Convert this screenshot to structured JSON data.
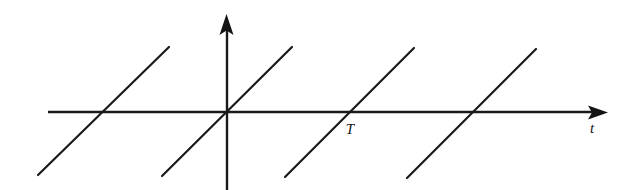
{
  "figure": {
    "kind": "sawtooth-waveform-diagram",
    "background_color": "#ffffff",
    "stroke_color": "#1a1a1a"
  },
  "axes": {
    "horizontal": {
      "label": "t",
      "label_x": 592,
      "label_y": 133,
      "start_x": 48,
      "end_x": 608,
      "y": 112,
      "arrow": "right-arrow-icon"
    },
    "vertical": {
      "label": "",
      "x": 227,
      "top_y": 14,
      "bottom_y": 190,
      "arrow": "up-arrow-icon"
    }
  },
  "annotations": [
    {
      "text": "T",
      "x": 350,
      "y": 134
    }
  ],
  "chart_data": {
    "type": "line",
    "title": "",
    "subtitle": "",
    "xlabel": "t",
    "ylabel": "",
    "grid": false,
    "legend": "none",
    "period_px": 122,
    "zero_crossings_px": [
      105,
      227,
      349,
      471
    ],
    "tick_labels": [
      "T"
    ],
    "xlim": [
      48,
      608
    ],
    "ylim": [
      190,
      14
    ],
    "series": [
      {
        "name": "sawtooth-segment-1",
        "points": [
          [
            38,
            175
          ],
          [
            169,
            47
          ]
        ]
      },
      {
        "name": "sawtooth-segment-2",
        "points": [
          [
            162,
            176
          ],
          [
            292,
            47
          ]
        ]
      },
      {
        "name": "sawtooth-segment-3",
        "points": [
          [
            285,
            177
          ],
          [
            414,
            48
          ]
        ]
      },
      {
        "name": "sawtooth-segment-4",
        "points": [
          [
            407,
            178
          ],
          [
            536,
            49
          ]
        ]
      }
    ]
  }
}
